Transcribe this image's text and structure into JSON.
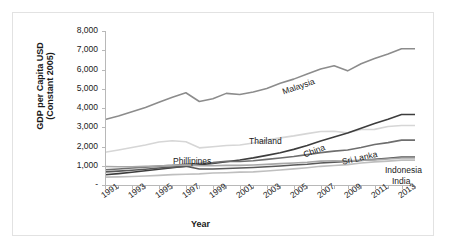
{
  "chart_data": {
    "type": "line",
    "title": "",
    "xlabel": "Year",
    "ylabel": "GDP per Capita USD (Constant 2005)",
    "ylabel_line1": "GDP per Capita USD",
    "ylabel_line2": "(Constant 2005)",
    "grid": false,
    "legend_position": "inline-labels",
    "ylim": [
      0,
      8000
    ],
    "ytick_labels": [
      "8,000",
      "7,000",
      "6,000",
      "5,000",
      "4,000",
      "3,000",
      "2,000",
      "1,000",
      "-"
    ],
    "ytick_values": [
      8000,
      7000,
      6000,
      5000,
      4000,
      3000,
      2000,
      1000,
      0
    ],
    "xtick_labels": [
      "1991",
      "1993",
      "1995",
      "1997",
      "1999",
      "2001",
      "2003",
      "2005",
      "2007",
      "2009",
      "2011",
      "2013"
    ],
    "x": [
      1991,
      1992,
      1993,
      1994,
      1995,
      1996,
      1997,
      1998,
      1999,
      2000,
      2001,
      2002,
      2003,
      2004,
      2005,
      2006,
      2007,
      2008,
      2009,
      2010,
      2011,
      2012,
      2013,
      2014
    ],
    "xlim": [
      1991,
      2014
    ],
    "series": [
      {
        "name": "Malaysia",
        "color": "#8c8c8c",
        "label_x": 268,
        "label_y": 74,
        "label_rotate": -19,
        "values": [
          3400,
          3580,
          3800,
          4030,
          4300,
          4560,
          4790,
          4340,
          4480,
          4760,
          4700,
          4830,
          5010,
          5280,
          5500,
          5760,
          6030,
          6190,
          5930,
          6300,
          6570,
          6800,
          7080,
          7080
        ]
      },
      {
        "name": "Thailand",
        "color": "#d6d6d6",
        "label_x": 236,
        "label_y": 123,
        "label_rotate": 0,
        "values": [
          1700,
          1820,
          1950,
          2080,
          2230,
          2300,
          2250,
          1930,
          1990,
          2050,
          2080,
          2180,
          2330,
          2450,
          2550,
          2670,
          2780,
          2790,
          2710,
          2880,
          2890,
          3040,
          3090,
          3090
        ]
      },
      {
        "name": "China",
        "color": "#3d3d3d",
        "label_x": 289,
        "label_y": 137,
        "label_rotate": -21,
        "values": [
          530,
          590,
          660,
          740,
          820,
          900,
          980,
          1050,
          1120,
          1210,
          1300,
          1410,
          1540,
          1680,
          1850,
          2050,
          2290,
          2490,
          2700,
          2950,
          3200,
          3420,
          3660,
          3660
        ]
      },
      {
        "name": "Sri Lanka",
        "color": "#6e6e6e",
        "label_x": 328,
        "label_y": 144,
        "label_rotate": -13,
        "values": [
          790,
          830,
          880,
          930,
          980,
          1020,
          1080,
          1120,
          1160,
          1230,
          1220,
          1260,
          1330,
          1400,
          1480,
          1580,
          1680,
          1760,
          1820,
          1950,
          2100,
          2200,
          2330,
          2330
        ]
      },
      {
        "name": "Indonesia",
        "color": "#595959",
        "label_x": 372,
        "label_y": 152,
        "label_rotate": 0,
        "values": [
          680,
          720,
          770,
          820,
          880,
          930,
          970,
          830,
          830,
          860,
          880,
          910,
          950,
          990,
          1040,
          1080,
          1140,
          1190,
          1220,
          1270,
          1330,
          1390,
          1450,
          1450
        ]
      },
      {
        "name": "India",
        "color": "#bfbfbf",
        "label_x": 379,
        "label_y": 163,
        "label_rotate": 0,
        "values": [
          410,
          420,
          440,
          470,
          500,
          540,
          560,
          580,
          620,
          640,
          670,
          680,
          730,
          780,
          840,
          900,
          970,
          1010,
          1060,
          1140,
          1200,
          1240,
          1290,
          1290
        ]
      },
      {
        "name": "Phillipines",
        "color": "#a8a8a8",
        "label_x": 160,
        "label_y": 143,
        "label_rotate": 0,
        "values": [
          960,
          950,
          950,
          970,
          990,
          1020,
          1040,
          1000,
          1000,
          1020,
          1020,
          1040,
          1070,
          1110,
          1140,
          1180,
          1240,
          1260,
          1250,
          1290,
          1300,
          1350,
          1400,
          1400
        ]
      }
    ]
  }
}
